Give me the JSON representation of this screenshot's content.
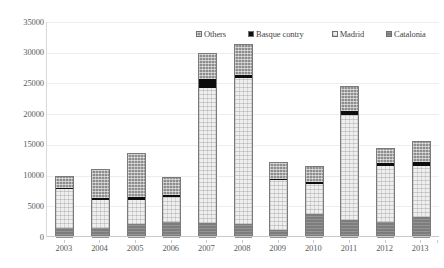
{
  "chart_data": {
    "type": "bar",
    "subtype": "stacked-bar",
    "title": "",
    "subtitle": "",
    "xlabel": "",
    "ylabel": "",
    "categories": [
      "2003",
      "2004",
      "2005",
      "2006",
      "2007",
      "2008",
      "2009",
      "2010",
      "2011",
      "2012",
      "2013"
    ],
    "ylim": [
      0,
      35000
    ],
    "ytick_values": [
      0,
      5000,
      10000,
      15000,
      20000,
      25000,
      30000,
      35000
    ],
    "ytick_labels": [
      "0",
      "5000",
      "10000",
      "15000",
      "20000",
      "25000",
      "30000",
      "35000"
    ],
    "grid": true,
    "grid_axis": "y",
    "legend_position": "top-center",
    "stack_order_bottom_to_top": [
      "Catalonia",
      "Madrid",
      "Basque contry",
      "Others"
    ],
    "series": [
      {
        "name": "Catalonia",
        "color": "#7d7d7d",
        "pattern": "solid-gray",
        "values": [
          1650,
          1600,
          2250,
          2600,
          2500,
          2300,
          1300,
          3900,
          2900,
          2550,
          3350
        ]
      },
      {
        "name": "Madrid",
        "color": "#efefef",
        "pattern": "light-dotted",
        "values": [
          6250,
          4550,
          3900,
          4050,
          22000,
          23750,
          8200,
          4900,
          17200,
          9200,
          8400
        ]
      },
      {
        "name": "Basque contry",
        "color": "#0d0d0d",
        "pattern": "solid-black",
        "values": [
          200,
          350,
          450,
          400,
          1400,
          450,
          150,
          300,
          600,
          450,
          700
        ]
      },
      {
        "name": "Others",
        "color": "#8e8e8e",
        "pattern": "cross-hatch",
        "values": [
          1900,
          4600,
          7100,
          2700,
          4000,
          4950,
          2550,
          2500,
          3900,
          2350,
          3200
        ]
      }
    ],
    "totals": [
      10000,
      11100,
      13700,
      9750,
      29900,
      31450,
      12200,
      11600,
      24600,
      14550,
      15650
    ]
  },
  "legend": {
    "items": [
      {
        "label": "Others",
        "swatch": "cross-hatch-swatch"
      },
      {
        "label": "Basque contry",
        "swatch": "black-swatch"
      },
      {
        "label": "Madrid",
        "swatch": "light-dotted-swatch"
      },
      {
        "label": "Catalonia",
        "swatch": "solid-gray-swatch"
      }
    ]
  },
  "axes": {
    "y_ticks": [
      "35000",
      "30000",
      "25000",
      "20000",
      "15000",
      "10000",
      "5000",
      "0"
    ],
    "x_ticks": [
      "2003",
      "2004",
      "2005",
      "2006",
      "2007",
      "2008",
      "2009",
      "2010",
      "2011",
      "2012",
      "2013"
    ]
  }
}
